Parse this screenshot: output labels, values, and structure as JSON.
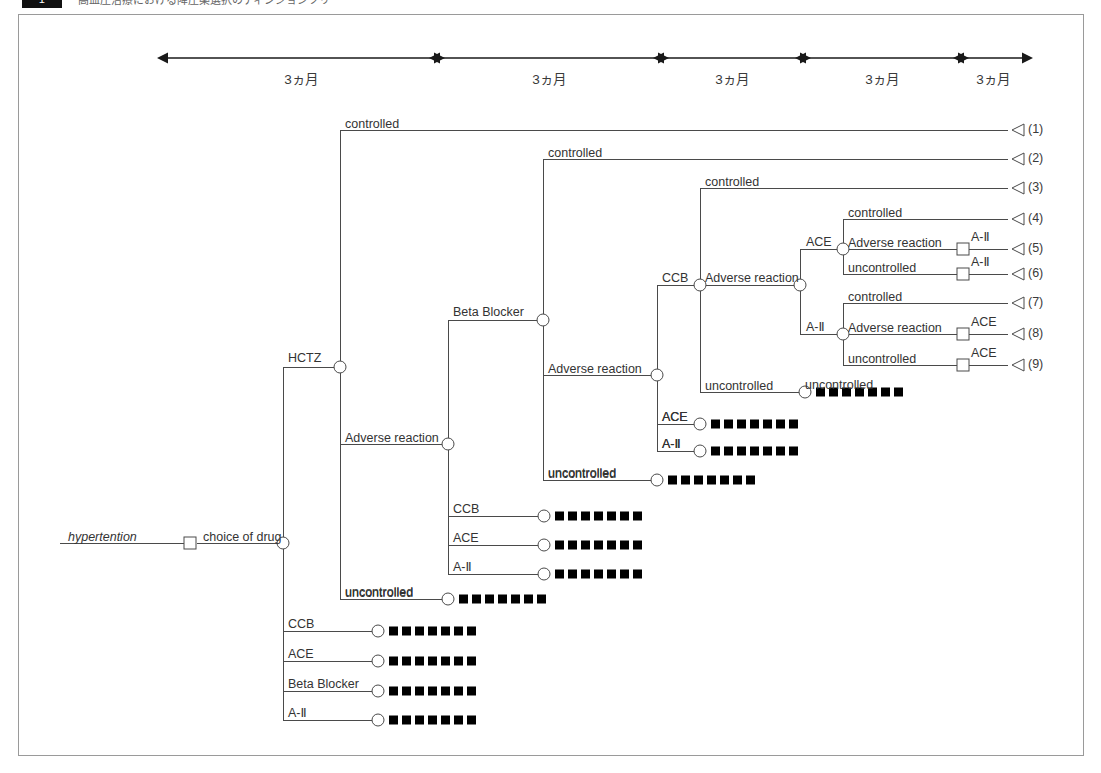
{
  "header": {
    "badge": "1",
    "caption": "高血圧治療における降圧薬選択のディシジョンツリー"
  },
  "figure": {
    "root_label": "hypertention",
    "root_decision_label": "choice of drug"
  },
  "timeline": {
    "segments": [
      {
        "label": "3ヵ月",
        "x1": 168,
        "x2": 434
      },
      {
        "label": "3ヵ月",
        "x1": 440,
        "x2": 658
      },
      {
        "label": "3ヵ月",
        "x1": 664,
        "x2": 800
      },
      {
        "label": "3ヵ月",
        "x1": 806,
        "x2": 958
      },
      {
        "label": "3ヵ月",
        "x1": 964,
        "x2": 1022
      }
    ],
    "y": 58
  },
  "labels": {
    "controlled": "controlled",
    "uncontrolled": "uncontrolled",
    "adverse_reaction": "Adverse reaction",
    "hctz": "HCTZ",
    "ccb": "CCB",
    "ace": "ACE",
    "beta_blocker": "Beta Blocker",
    "a2": "A-Ⅱ"
  },
  "outcomes": [
    {
      "id": "1",
      "label": "(1)",
      "y": 130
    },
    {
      "id": "2",
      "label": "(2)",
      "y": 159
    },
    {
      "id": "3",
      "label": "(3)",
      "y": 188
    },
    {
      "id": "4",
      "label": "(4)",
      "y": 219
    },
    {
      "id": "5",
      "label": "(5)",
      "y": 249
    },
    {
      "id": "6",
      "label": "(6)",
      "y": 274
    },
    {
      "id": "7",
      "label": "(7)",
      "y": 303
    },
    {
      "id": "8",
      "label": "(8)",
      "y": 334
    },
    {
      "id": "9",
      "label": "(9)",
      "y": 365
    }
  ],
  "tree_nodes": [
    {
      "name": "root-decision",
      "type": "square",
      "x": 190,
      "y": 543
    },
    {
      "name": "root-chance",
      "type": "circle",
      "x": 283,
      "y": 543
    },
    {
      "name": "hctz-chance",
      "type": "circle",
      "x": 340,
      "y": 367
    },
    {
      "name": "hctz-adverse-chance",
      "type": "circle",
      "x": 448,
      "y": 444
    },
    {
      "name": "betablocker-chance",
      "type": "circle",
      "x": 543,
      "y": 320
    },
    {
      "name": "betablocker-adverse-chance",
      "type": "circle",
      "x": 657,
      "y": 375
    },
    {
      "name": "ccb-chance",
      "type": "circle",
      "x": 700,
      "y": 285
    },
    {
      "name": "ccb-adverse-chance",
      "type": "circle",
      "x": 800,
      "y": 285
    },
    {
      "name": "ace-chance",
      "type": "circle",
      "x": 843,
      "y": 249
    },
    {
      "name": "a2-chance",
      "type": "circle",
      "x": 843,
      "y": 334
    }
  ],
  "terminal_marker": {
    "name": "censored-marker",
    "squares": 7,
    "square_size": 9,
    "gap": 4,
    "color": "#000000"
  },
  "terminal_rows": [
    {
      "name": "ccb-uncontrolled",
      "label": "uncontrolled",
      "node_x": 805,
      "y": 392,
      "branch_x": 800,
      "marker_x": 816
    },
    {
      "name": "bb-adverse-ace",
      "label": "ACE",
      "node_x": 700,
      "y": 424,
      "branch_x": 657,
      "marker_x": 711
    },
    {
      "name": "bb-adverse-a2",
      "label": "A-Ⅱ",
      "node_x": 700,
      "y": 451,
      "branch_x": 657,
      "marker_x": 711
    },
    {
      "name": "bb-uncontrolled",
      "label": "uncontrolled",
      "node_x": 657,
      "y": 480,
      "branch_x": 543,
      "marker_x": 668
    },
    {
      "name": "hctz-adverse-ccb",
      "label": "CCB",
      "node_x": 544,
      "y": 516,
      "branch_x": 448,
      "marker_x": 555
    },
    {
      "name": "hctz-adverse-ace",
      "label": "ACE",
      "node_x": 544,
      "y": 545,
      "branch_x": 448,
      "marker_x": 555
    },
    {
      "name": "hctz-adverse-a2",
      "label": "A-Ⅱ",
      "node_x": 544,
      "y": 574,
      "branch_x": 448,
      "marker_x": 555
    },
    {
      "name": "hctz-uncontrolled",
      "label": "uncontrolled",
      "node_x": 448,
      "y": 599,
      "branch_x": 340,
      "marker_x": 459
    },
    {
      "name": "root-ccb",
      "label": "CCB",
      "node_x": 378,
      "y": 631,
      "branch_x": 283,
      "marker_x": 389
    },
    {
      "name": "root-ace",
      "label": "ACE",
      "node_x": 378,
      "y": 661,
      "branch_x": 283,
      "marker_x": 389
    },
    {
      "name": "root-beta-blocker",
      "label": "Beta Blocker",
      "node_x": 378,
      "y": 691,
      "branch_x": 283,
      "marker_x": 389
    },
    {
      "name": "root-a2",
      "label": "A-Ⅱ",
      "node_x": 378,
      "y": 720,
      "branch_x": 283,
      "marker_x": 389
    }
  ],
  "square_terminals": [
    {
      "name": "ace-adverse-a2",
      "label": "A-Ⅱ",
      "x": 963,
      "y": 249
    },
    {
      "name": "ace-uncontrolled-a2",
      "label": "A-Ⅱ",
      "x": 963,
      "y": 274
    },
    {
      "name": "a2-adverse-ace",
      "label": "ACE",
      "x": 963,
      "y": 334
    },
    {
      "name": "a2-uncontrolled-ace",
      "label": "ACE",
      "x": 963,
      "y": 365
    }
  ],
  "colors": {
    "line": "#4a4a4a",
    "text": "#333333",
    "marker": "#000000",
    "frame": "#9a9a9a",
    "background": "#ffffff"
  }
}
